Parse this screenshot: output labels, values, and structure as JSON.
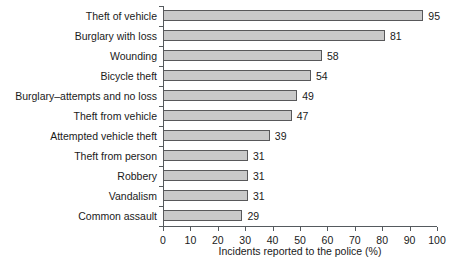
{
  "chart_data": {
    "type": "bar",
    "orientation": "horizontal",
    "title": "",
    "xlabel": "Incidents reported to the police (%)",
    "ylabel": "",
    "xlim": [
      0,
      100
    ],
    "xticks": [
      0,
      10,
      20,
      30,
      40,
      50,
      60,
      70,
      80,
      90,
      100
    ],
    "grid": false,
    "legend": null,
    "bar_fill_color": "#c9c9c9",
    "bar_border_color": "#58585a",
    "axis_color": "#555a5e",
    "categories": [
      "Theft of vehicle",
      "Burglary with loss",
      "Wounding",
      "Bicycle theft",
      "Burglary–attempts and no loss",
      "Theft from vehicle",
      "Attempted vehicle theft",
      "Theft from person",
      "Robbery",
      "Vandalism",
      "Common assault"
    ],
    "values": [
      95,
      81,
      58,
      54,
      49,
      47,
      39,
      31,
      31,
      31,
      29
    ],
    "value_labels": [
      "95",
      "81",
      "58",
      "54",
      "49",
      "47",
      "39",
      "31",
      "31",
      "31",
      "29"
    ]
  }
}
